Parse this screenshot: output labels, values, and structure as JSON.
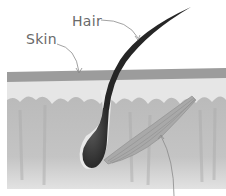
{
  "diagram": {
    "labels": [
      {
        "id": "hair",
        "text": "Hair"
      },
      {
        "id": "skin",
        "text": "Skin"
      }
    ],
    "parts": [
      "epidermis",
      "dermis",
      "hair-shaft",
      "hair-follicle",
      "arrector-pili-muscle"
    ],
    "colors": {
      "epidermis": "#9c9c9c",
      "upper_layer": "#e4e4e4",
      "dermis": "#bdbdbd",
      "hair": "#2a2a2a",
      "muscle": "#a8a8a8",
      "label_text": "#6a6a6a",
      "leader_line": "#8a8a8a"
    }
  }
}
